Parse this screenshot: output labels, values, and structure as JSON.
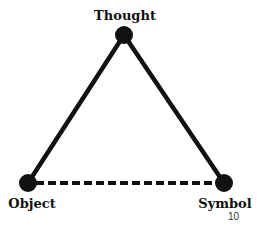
{
  "diagram": {
    "nodes": [
      {
        "id": "thought",
        "label": "Thought"
      },
      {
        "id": "object",
        "label": "Object"
      },
      {
        "id": "symbol",
        "label": "Symbol"
      }
    ],
    "edges": [
      {
        "from": "thought",
        "to": "object",
        "style": "solid"
      },
      {
        "from": "thought",
        "to": "symbol",
        "style": "solid"
      },
      {
        "from": "object",
        "to": "symbol",
        "style": "dashed"
      }
    ],
    "colors": {
      "ink": "#111111",
      "background": "#ffffff"
    }
  },
  "page_number": "10"
}
